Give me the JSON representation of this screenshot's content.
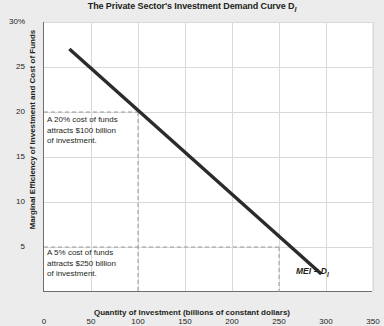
{
  "chart_data": {
    "type": "line",
    "title": "The Private Sector's Investment Demand Curve D",
    "title_subscript": "I",
    "xlabel": "Quantity of Investment (billions of constant dollars)",
    "ylabel": "Marginal Efficiency of Investment and Cost of Funds",
    "xlim": [
      0,
      350
    ],
    "ylim": [
      0,
      30
    ],
    "xticks": [
      "0",
      "50",
      "100",
      "150",
      "200",
      "250",
      "300",
      "350"
    ],
    "xtick_values": [
      0,
      50,
      100,
      150,
      200,
      250,
      300,
      350
    ],
    "yticks": [
      "5",
      "10",
      "15",
      "20",
      "25",
      "30%"
    ],
    "ytick_values": [
      5,
      10,
      15,
      20,
      25,
      30
    ],
    "grid": true,
    "legend_position": "none",
    "series": [
      {
        "name": "MEI = D_I",
        "label": "MEI = D",
        "label_subscript": "I",
        "color": "#2b2b2b",
        "x": [
          27,
          295
        ],
        "y": [
          27,
          2
        ]
      }
    ],
    "guides": [
      {
        "price": 20,
        "quantity": 100,
        "style": "dashed"
      },
      {
        "price": 5,
        "quantity": 250,
        "style": "dashed"
      }
    ],
    "annotations": [
      {
        "id": "annotation-20",
        "lines": [
          "A 20% cost of funds",
          "attracts $100 billion",
          "of investment."
        ]
      },
      {
        "id": "annotation-5",
        "lines": [
          "A 5% cost of funds",
          "attracts $250 billion",
          "of investment."
        ]
      }
    ],
    "colors": {
      "background": "#ececec",
      "plot_background": "#ffffff",
      "axis": "#6d6e71",
      "grid": "#d9d9d9",
      "curve": "#2b2b2b",
      "guide": "#9a9a9a",
      "text": "#231f20"
    }
  }
}
